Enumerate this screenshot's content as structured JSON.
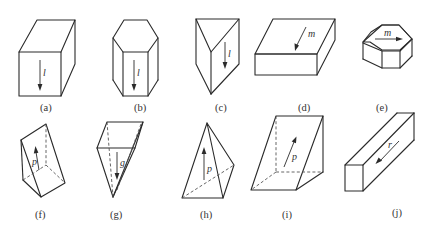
{
  "figure": {
    "line_color": "#2a2a2a",
    "panels": [
      {
        "id": "a",
        "caption": "(a)",
        "shape": "rectangular prism (tall)",
        "vector_label": "l",
        "vector_direction": "down"
      },
      {
        "id": "b",
        "caption": "(b)",
        "shape": "hexagonal prism",
        "vector_label": "l",
        "vector_direction": "down"
      },
      {
        "id": "c",
        "caption": "(c)",
        "shape": "triangular prism",
        "vector_label": "l",
        "vector_direction": "down"
      },
      {
        "id": "d",
        "caption": "(d)",
        "shape": "flat rectangular box",
        "vector_label": "m",
        "vector_direction": "down-left on top face"
      },
      {
        "id": "e",
        "caption": "(e)",
        "shape": "octagonal tablet",
        "vector_label": "m",
        "vector_direction": "right on top face"
      },
      {
        "id": "f",
        "caption": "(f)",
        "shape": "triangular wedge",
        "vector_label": "p",
        "vector_direction": "up"
      },
      {
        "id": "g",
        "caption": "(g)",
        "shape": "inverted wedge",
        "vector_label": "g",
        "vector_direction": "down"
      },
      {
        "id": "h",
        "caption": "(h)",
        "shape": "tetrahedron / pyramid",
        "vector_label": "p",
        "vector_direction": "up"
      },
      {
        "id": "i",
        "caption": "(i)",
        "shape": "inclined wedge",
        "vector_label": "p",
        "vector_direction": "up-right"
      },
      {
        "id": "j",
        "caption": "(j)",
        "shape": "long bar",
        "vector_label": "r",
        "vector_direction": "down-left along bar"
      }
    ]
  }
}
